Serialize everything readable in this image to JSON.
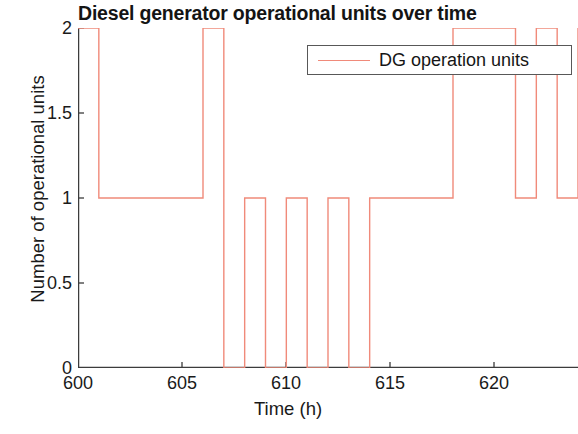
{
  "chart_data": {
    "type": "line",
    "subtype": "step",
    "title": "Diesel generator operational units over time",
    "xlabel": "Time (h)",
    "ylabel": "Number of operational units",
    "xlim": [
      600,
      624
    ],
    "ylim": [
      0,
      2
    ],
    "xticks": [
      600,
      605,
      610,
      615,
      620
    ],
    "yticks": [
      0,
      0.5,
      1,
      1.5,
      2
    ],
    "xtick_labels": [
      "600",
      "605",
      "610",
      "615",
      "620"
    ],
    "ytick_labels": [
      "0",
      "0.5",
      "1",
      "1.5",
      "2"
    ],
    "grid": false,
    "legend_position": "top-right",
    "series": [
      {
        "name": "DG operation units",
        "color": "#f08a7a",
        "x": [
          600,
          601,
          602,
          603,
          604,
          605,
          606,
          607,
          608,
          609,
          610,
          611,
          612,
          613,
          614,
          615,
          616,
          617,
          618,
          619,
          620,
          621,
          622,
          623,
          624
        ],
        "values": [
          2,
          1,
          1,
          1,
          1,
          1,
          2,
          0,
          1,
          0,
          1,
          0,
          1,
          0,
          1,
          1,
          1,
          1,
          2,
          2,
          2,
          1,
          2,
          1,
          2
        ]
      }
    ]
  },
  "legend": {
    "entries": [
      {
        "label": "DG operation units",
        "color": "#f08a7a",
        "marker": "line"
      }
    ]
  },
  "colors": {
    "series": "#f08a7a",
    "axis": "#3c3c3c",
    "text": "#1a1a1a",
    "background": "#ffffff"
  }
}
